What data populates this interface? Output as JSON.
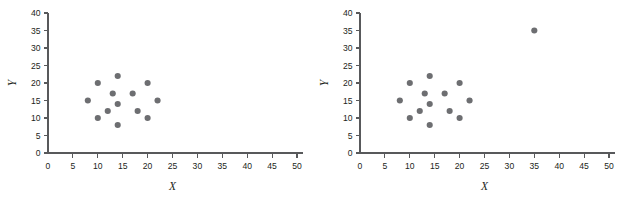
{
  "figure": {
    "title": "",
    "panel_count": 2
  },
  "chart_data": [
    {
      "type": "scatter",
      "title": "",
      "subtitle": "",
      "panel_label": "left",
      "xlabel": "X",
      "ylabel": "Y",
      "xlim": [
        0,
        50
      ],
      "ylim": [
        0,
        40
      ],
      "xticks": [
        0,
        5,
        10,
        15,
        20,
        25,
        30,
        35,
        40,
        45,
        50
      ],
      "yticks": [
        0,
        5,
        10,
        15,
        20,
        25,
        30,
        35,
        40
      ],
      "xtick_labels": [
        "0",
        "5",
        "10",
        "15",
        "20",
        "25",
        "30",
        "35",
        "40",
        "45",
        "50"
      ],
      "ytick_labels": [
        "0",
        "5",
        "10",
        "15",
        "20",
        "25",
        "30",
        "35",
        "40"
      ],
      "grid": false,
      "legend": false,
      "legend_position": "none",
      "marker_color": "#6d6e71",
      "marker_size": 4.6,
      "points": [
        {
          "x": 8,
          "y": 15
        },
        {
          "x": 10,
          "y": 20
        },
        {
          "x": 10,
          "y": 10
        },
        {
          "x": 12,
          "y": 12
        },
        {
          "x": 13,
          "y": 17
        },
        {
          "x": 14,
          "y": 22
        },
        {
          "x": 14,
          "y": 14
        },
        {
          "x": 14,
          "y": 8
        },
        {
          "x": 17,
          "y": 17
        },
        {
          "x": 18,
          "y": 12
        },
        {
          "x": 20,
          "y": 20
        },
        {
          "x": 20,
          "y": 10
        },
        {
          "x": 22,
          "y": 15
        }
      ]
    },
    {
      "type": "scatter",
      "title": "",
      "subtitle": "",
      "panel_label": "right",
      "xlabel": "X",
      "ylabel": "Y",
      "xlim": [
        0,
        50
      ],
      "ylim": [
        0,
        40
      ],
      "xticks": [
        0,
        5,
        10,
        15,
        20,
        25,
        30,
        35,
        40,
        45,
        50
      ],
      "yticks": [
        0,
        5,
        10,
        15,
        20,
        25,
        30,
        35,
        40
      ],
      "xtick_labels": [
        "0",
        "5",
        "10",
        "15",
        "20",
        "25",
        "30",
        "35",
        "40",
        "45",
        "50"
      ],
      "ytick_labels": [
        "0",
        "5",
        "10",
        "15",
        "20",
        "25",
        "30",
        "35",
        "40"
      ],
      "grid": false,
      "legend": false,
      "legend_position": "none",
      "marker_color": "#6d6e71",
      "marker_size": 4.6,
      "points": [
        {
          "x": 8,
          "y": 15
        },
        {
          "x": 10,
          "y": 20
        },
        {
          "x": 10,
          "y": 10
        },
        {
          "x": 12,
          "y": 12
        },
        {
          "x": 13,
          "y": 17
        },
        {
          "x": 14,
          "y": 22
        },
        {
          "x": 14,
          "y": 14
        },
        {
          "x": 14,
          "y": 8
        },
        {
          "x": 17,
          "y": 17
        },
        {
          "x": 18,
          "y": 12
        },
        {
          "x": 20,
          "y": 20
        },
        {
          "x": 20,
          "y": 10
        },
        {
          "x": 22,
          "y": 15
        },
        {
          "x": 35,
          "y": 35
        }
      ]
    }
  ]
}
